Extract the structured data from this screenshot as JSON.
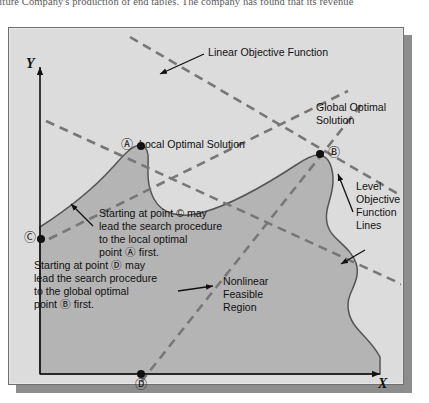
{
  "page": {
    "running_text": "niture Company's production of end tables. The company has found that its revenue"
  },
  "figure": {
    "axis_x_label": "X",
    "axis_y_label": "Y",
    "labels": {
      "linear_objective_function": "Linear Objective Function",
      "global_optimal_solution_line1": "Global Optimal",
      "global_optimal_solution_line2": "Solution",
      "local_optimal_solution": "Local Optimal Solution",
      "level_objective_line1": "Level",
      "level_objective_line2": "Objective",
      "level_objective_line3": "Function",
      "level_objective_line4": "Lines",
      "feasible_region_line1": "Nonlinear",
      "feasible_region_line2": "Feasible",
      "feasible_region_line3": "Region",
      "note_c_line1": "Starting at point © may",
      "note_c_line2": "lead the search procedure",
      "note_c_line3": "to the local optimal",
      "note_c_line4": "point Ⓐ first.",
      "note_d_line1": "Starting at point Ⓓ may",
      "note_d_line2": "lead the search procedure",
      "note_d_line3": "to the global optimal",
      "note_d_line4": "point Ⓑ first."
    },
    "points": [
      {
        "id": "A",
        "glyph": "Ⓐ",
        "name": "local-optimal-point",
        "x": 141,
        "y": 127
      },
      {
        "id": "B",
        "glyph": "Ⓑ",
        "name": "global-optimal-point",
        "x": 312,
        "y": 131
      },
      {
        "id": "C",
        "glyph": "Ⓒ",
        "name": "start-point-c",
        "x": 41,
        "y": 212
      },
      {
        "id": "D",
        "glyph": "Ⓓ",
        "name": "start-point-d",
        "x": 133,
        "y": 355
      }
    ],
    "colors": {
      "panel_background": "#dcdcdc",
      "feasible_region_fill": "#b4b4b4",
      "region_outline": "#555555",
      "dashed_line": "#777777",
      "axis": "#111111",
      "shadow": "#8d8d8d"
    }
  }
}
